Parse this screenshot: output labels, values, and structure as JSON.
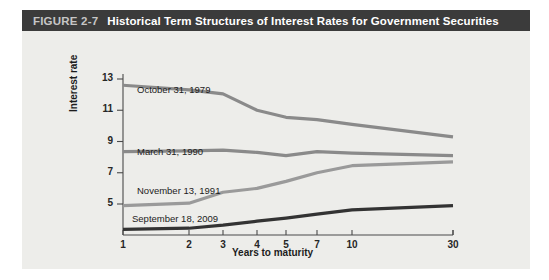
{
  "figure": {
    "number": "FIGURE 2-7",
    "title": "Historical Term Structures of Interest Rates for Government Securities"
  },
  "chart_data": {
    "type": "line",
    "title": "Historical Term Structures of Interest Rates for Government Securities",
    "xlabel": "Years to maturity",
    "ylabel": "Interest rate",
    "x_tick_labels": [
      "1",
      "2",
      "3",
      "4",
      "5",
      "7",
      "10",
      "30"
    ],
    "x_categories": [
      1,
      2,
      3,
      4,
      5,
      7,
      10,
      30
    ],
    "y_tick_labels": [
      "5",
      "7",
      "9",
      "11",
      "13"
    ],
    "yticks": [
      5,
      7,
      9,
      11,
      13
    ],
    "ylim": [
      3.0,
      13.6
    ],
    "grid": false,
    "legend_position": "inline-labels",
    "series": [
      {
        "name": "October 31, 1979",
        "color": "#8a8a8a",
        "values": [
          12.6,
          12.3,
          12.05,
          11.0,
          10.55,
          10.4,
          10.1,
          9.3
        ]
      },
      {
        "name": "March 31, 1990",
        "color": "#8a8a8a",
        "values": [
          8.35,
          8.4,
          8.45,
          8.3,
          8.1,
          8.35,
          8.25,
          8.1
        ]
      },
      {
        "name": "November 13, 1991",
        "color": "#9a9a9a",
        "values": [
          4.9,
          5.05,
          5.75,
          6.0,
          6.45,
          7.0,
          7.45,
          7.7
        ]
      },
      {
        "name": "September 18, 2009",
        "color": "#333333",
        "values": [
          3.38,
          3.45,
          3.65,
          3.9,
          4.1,
          4.35,
          4.62,
          4.9
        ]
      }
    ],
    "annotations": [
      {
        "text": "October 31, 1979",
        "x_px": 137,
        "y_px": 84
      },
      {
        "text": "March 31, 1990",
        "x_px": 137,
        "y_px": 146
      },
      {
        "text": "November 13, 1991",
        "x_px": 137,
        "y_px": 185
      },
      {
        "text": "September 18, 2009",
        "x_px": 132,
        "y_px": 213
      }
    ]
  },
  "colors": {
    "title_bar": "#3b3b3b",
    "title_number": "#c6c6c6",
    "title_text": "#ffffff",
    "panel_background": "#ededea",
    "axis": "#4a4a4a",
    "page_background": "#ffffff"
  }
}
